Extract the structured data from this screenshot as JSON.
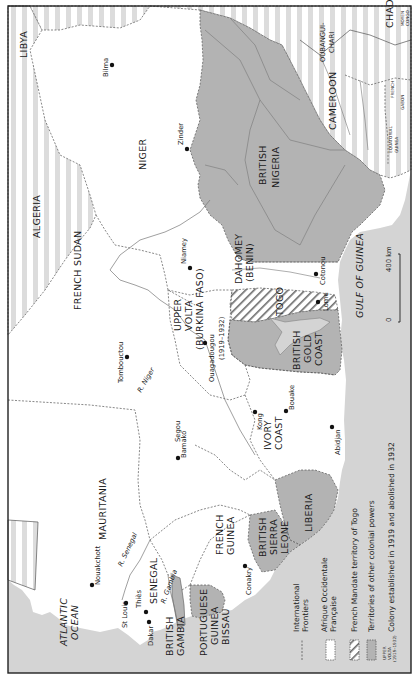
{
  "map": {
    "title": "French West Africa (Afrique Occidentale Française)",
    "orientation": "rotated 90° clockwise; text reads bottom-to-top",
    "colors": {
      "sea": "#d4d4d4",
      "afrique_occidentale_francaise": "#ffffff",
      "other_colonial_powers": "#b3b3b3",
      "stripe_light": "#dcdcdc",
      "frontier": "#555555",
      "river": "#7a7a7a",
      "border": "#222222"
    },
    "regions": {
      "libya": "LIBYA",
      "chad": "CHAD",
      "oubangui_chari_1": "OUBANGUI-",
      "oubangui_chari_2": "CHARI",
      "french_1": "FRENCH",
      "moyen_congo_1": "MOYEN",
      "moyen_congo_2": "CONGO",
      "cameroon": "CAMEROON",
      "equatorial_guinea_1": "EQUATORIAL",
      "equatorial_guinea_2": "GUINEA",
      "gabon": "GABON",
      "niger": "NIGER",
      "algeria": "ALGERIA",
      "british_nigeria_1": "BRITISH",
      "british_nigeria_2": "NIGERIA",
      "french_sudan": "FRENCH SUDAN",
      "dahomey_1": "DAHOMEY",
      "dahomey_2": "(BENIN)",
      "togo": "TOGO",
      "upper_volta_1": "UPPER",
      "upper_volta_2": "VOLTA",
      "upper_volta_3": "(BURKINA FASO)",
      "upper_volta_4": "(1919–1932)",
      "british_gold_coast_1": "BRITISH",
      "british_gold_coast_2": "GOLD",
      "british_gold_coast_3": "COAST",
      "ivory_coast_1": "IVORY",
      "ivory_coast_2": "COAST",
      "mauritania": "MAURITANIA",
      "liberia": "LIBERIA",
      "french_guinea_1": "FRENCH",
      "french_guinea_2": "GUINEA",
      "british_sierra_leone_1": "BRITISH",
      "british_sierra_leone_2": "SIERRA",
      "british_sierra_leone_3": "LEONE",
      "senegal": "SENEGAL",
      "portuguese_guinea_1": "PORTUGUESE",
      "portuguese_guinea_2": "GUINEA",
      "portuguese_guinea_3": "BISSAU",
      "british_gambia_1": "BRITISH",
      "british_gambia_2": "GAMBIA",
      "atlantic_ocean_1": "ATLANTIC",
      "atlantic_ocean_2": "OCEAN",
      "gulf_of_guinea": "GULF OF GUINEA"
    },
    "cities": {
      "bilma": "Bilma",
      "zinder": "Zinder",
      "niamey": "Niamey",
      "cotonou": "Cotonou",
      "lome": "Lome",
      "tombouctou": "Tombouctou",
      "ouagadougou": "Ouagadougou",
      "segou": "Segou",
      "bamako": "Bamako",
      "kong": "Kong",
      "bouake": "Bouake",
      "abidjan": "Abidjan",
      "nouakchott": "Nouakchott",
      "st_louis": "St Louis",
      "thies": "Thiès",
      "dakar": "Dakar",
      "conakry": "Conakry"
    },
    "rivers": {
      "niger": "R. Niger",
      "senegal": "R. Senegal",
      "gambia": "R. Gambia"
    },
    "scale": {
      "zero": "0",
      "max": "400 km"
    }
  },
  "legend": {
    "items": [
      {
        "symbol": "dashed-line",
        "label_1": "International",
        "label_2": "Frontiers"
      },
      {
        "symbol": "white-box",
        "label_1": "Afrique Occidentale",
        "label_2": "Française"
      },
      {
        "symbol": "hatched-box",
        "label_1": "French Mandate territory of Togo",
        "label_2": ""
      },
      {
        "symbol": "grey-box",
        "label_1": "Territories of other colonial powers",
        "label_2": ""
      },
      {
        "symbol": "upper-volta-text",
        "label_1": "Colony established in 1919 and abolished in 1932",
        "label_2": ""
      }
    ],
    "upper_volta_symbol": {
      "line1": "UPPER",
      "line2": "VOLTA",
      "line3": "(1919–1932)"
    }
  }
}
